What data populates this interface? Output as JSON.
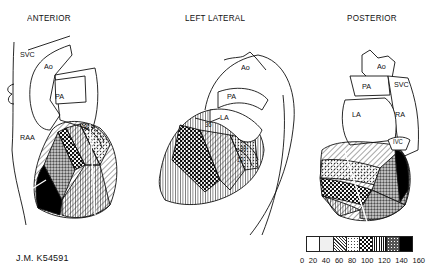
{
  "views": [
    {
      "title": "ANTERIOR",
      "labels": [
        "SVC",
        "Ao",
        "PA",
        "RAA",
        "36"
      ]
    },
    {
      "title": "LEFT LATERAL",
      "labels": [
        "Ao",
        "PA",
        "LA",
        "36",
        "30",
        "10"
      ]
    },
    {
      "title": "POSTERIOR",
      "labels": [
        "Ao",
        "PA",
        "SVC",
        "LA",
        "RA",
        "IVC"
      ]
    }
  ],
  "patient_id": "J.M. K54591",
  "legend": {
    "ticks": [
      "0",
      "20",
      "40",
      "60",
      "80",
      "100",
      "120",
      "140",
      "160"
    ],
    "bins": [
      {
        "range": "0-20",
        "pattern": "blank",
        "color": "#ffffff"
      },
      {
        "range": "20-40",
        "pattern": "light-stipple",
        "color": "#eeeeee"
      },
      {
        "range": "40-60",
        "pattern": "diagonal-hatch",
        "color": "#cccccc"
      },
      {
        "range": "60-80",
        "pattern": "fine-dots",
        "color": "#bbbbbb"
      },
      {
        "range": "80-100",
        "pattern": "checker",
        "color": "#777777"
      },
      {
        "range": "100-120",
        "pattern": "vertical-lines",
        "color": "#999999"
      },
      {
        "range": "120-140",
        "pattern": "coarse-stipple",
        "color": "#555555"
      },
      {
        "range": "140-160",
        "pattern": "solid-black",
        "color": "#000000"
      }
    ]
  }
}
